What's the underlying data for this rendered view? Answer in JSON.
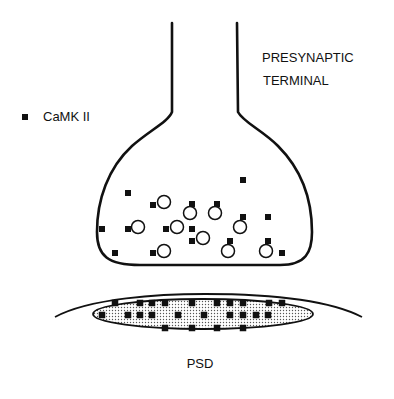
{
  "labels": {
    "presynaptic_line1": "PRESYNAPTIC",
    "presynaptic_line2": "TERMINAL",
    "legend": "CaMK II",
    "psd": "PSD"
  },
  "colors": {
    "ink": "#111111",
    "background": "#ffffff",
    "psd_fill_dots": "#555555"
  },
  "terminal": {
    "camk_squares": [
      [
        128,
        193
      ],
      [
        243,
        180
      ],
      [
        153,
        205
      ],
      [
        192,
        204
      ],
      [
        217,
        204
      ],
      [
        243,
        217
      ],
      [
        268,
        217
      ],
      [
        102,
        229
      ],
      [
        128,
        229
      ],
      [
        166,
        229
      ],
      [
        192,
        229
      ],
      [
        192,
        241
      ],
      [
        230,
        241
      ],
      [
        268,
        241
      ],
      [
        115,
        253
      ],
      [
        153,
        253
      ],
      [
        282,
        253
      ]
    ],
    "vesicles": [
      [
        164,
        202
      ],
      [
        190,
        213
      ],
      [
        215,
        213
      ],
      [
        240,
        227
      ],
      [
        138,
        227
      ],
      [
        177,
        227
      ],
      [
        203,
        238
      ],
      [
        164,
        251
      ],
      [
        228,
        251
      ],
      [
        266,
        251
      ]
    ]
  },
  "psd": {
    "camk_squares": [
      [
        115,
        303
      ],
      [
        140,
        303
      ],
      [
        152,
        303
      ],
      [
        165,
        303
      ],
      [
        192,
        303
      ],
      [
        217,
        303
      ],
      [
        230,
        303
      ],
      [
        243,
        303
      ],
      [
        269,
        303
      ],
      [
        282,
        303
      ],
      [
        102,
        315
      ],
      [
        128,
        315
      ],
      [
        140,
        315
      ],
      [
        152,
        315
      ],
      [
        178,
        315
      ],
      [
        204,
        315
      ],
      [
        230,
        315
      ],
      [
        243,
        315
      ],
      [
        256,
        315
      ],
      [
        268,
        315
      ],
      [
        165,
        328
      ],
      [
        192,
        328
      ],
      [
        217,
        328
      ],
      [
        243,
        328
      ]
    ]
  }
}
